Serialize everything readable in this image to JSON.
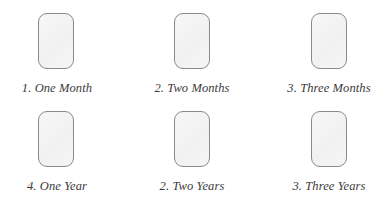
{
  "figure": {
    "background_color": "#ffffff",
    "shape_fill_color": "#f4f4f4",
    "shape_border_color": "#8a8a8a",
    "caption_color": "#3b3b3b",
    "rows": 2,
    "columns": 3
  },
  "items": [
    {
      "id": "one-month",
      "caption": "1. One Month",
      "icon": "rounded-rectangle-tablet-icon"
    },
    {
      "id": "two-months",
      "caption": "2. Two Months",
      "icon": "rounded-rectangle-tablet-icon"
    },
    {
      "id": "three-months",
      "caption": "3. Three Months",
      "icon": "rounded-rectangle-tablet-icon"
    },
    {
      "id": "one-year",
      "caption": "4. One Year",
      "icon": "rounded-rectangle-tablet-icon"
    },
    {
      "id": "two-years",
      "caption": "2. Two Years",
      "icon": "rounded-rectangle-tablet-icon"
    },
    {
      "id": "three-years",
      "caption": "3. Three Years",
      "icon": "rounded-rectangle-tablet-icon"
    }
  ]
}
